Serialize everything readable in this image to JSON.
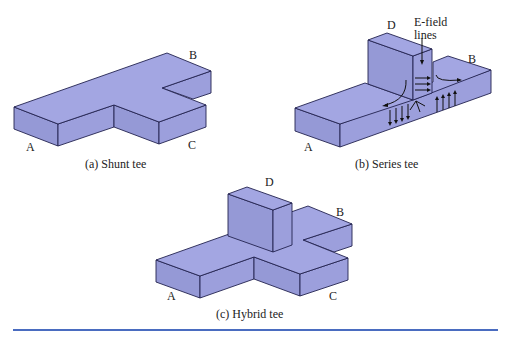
{
  "figure": {
    "panels": [
      {
        "id": "a",
        "caption": "(a) Shunt tee",
        "ports": {
          "A": "A",
          "B": "B",
          "C": "C"
        }
      },
      {
        "id": "b",
        "caption": "(b) Series tee",
        "ports": {
          "A": "A",
          "B": "B",
          "D": "D"
        },
        "annotation": {
          "line1": "E-field",
          "line2": "lines"
        }
      },
      {
        "id": "c",
        "caption": "(c) Hybrid tee",
        "ports": {
          "A": "A",
          "B": "B",
          "C": "C",
          "D": "D"
        }
      }
    ],
    "colors": {
      "waveguide_fill": "#9c9fdc",
      "edge": "#23234f",
      "rule": "#4a6cc0"
    }
  }
}
